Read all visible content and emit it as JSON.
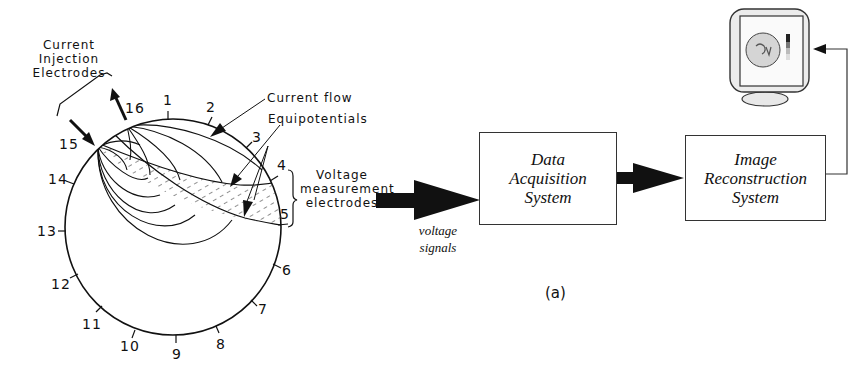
{
  "figure": {
    "caption": "(a)",
    "phantom": {
      "electrodes": [
        "1",
        "2",
        "3",
        "4",
        "5",
        "6",
        "7",
        "8",
        "9",
        "10",
        "11",
        "12",
        "13",
        "14",
        "15",
        "16"
      ],
      "labels": {
        "injection": [
          "Current",
          "Injection",
          "Electrodes"
        ],
        "current_flow": "Current flow",
        "equipotentials": "Equipotentials",
        "voltage_measurement": [
          "Voltage",
          "measurement",
          "electrodes"
        ]
      }
    },
    "signal_label": [
      "voltage",
      "signals"
    ],
    "blocks": {
      "data_acquisition": [
        "Data",
        "Acquisition",
        "System"
      ],
      "image_reconstruction": [
        "Image",
        "Reconstruction",
        "System"
      ]
    },
    "display": {
      "icon": "monitor-icon"
    },
    "colors": {
      "ink": "#111111",
      "box_border": "#333333",
      "hatch": "#555555",
      "background": "#ffffff"
    }
  }
}
